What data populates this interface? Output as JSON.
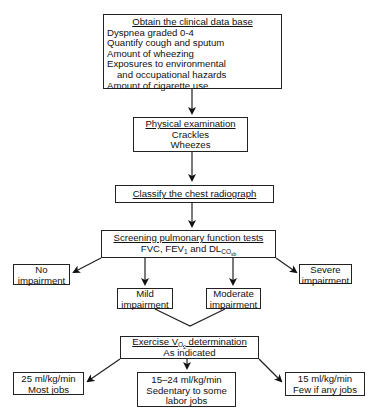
{
  "flowchart": {
    "clinical_data": {
      "title": "Obtain the clinical data base",
      "items": [
        "Dyspnea graded 0-4",
        "Quantify cough and sputum",
        "Amount of wheezing",
        "Exposures to environmental",
        "and occupational hazards",
        "Amount of cigarette use"
      ]
    },
    "physical_exam": {
      "title": "Physical examination",
      "items": [
        "Crackles",
        "Wheezes"
      ]
    },
    "radiograph": {
      "title": "Classify the chest radiograph"
    },
    "screening": {
      "title": "Screening pulmonary function tests",
      "line2_a": "FVC, FEV",
      "line2_sub1": "1",
      "line2_b": " and DL",
      "line2_sub2": "CO",
      "line2_sub3": "sb"
    },
    "impairment": {
      "none": [
        "No",
        "impairment"
      ],
      "mild": [
        "Mild",
        "impairment"
      ],
      "moderate": [
        "Moderate",
        "impairment"
      ],
      "severe": [
        "Severe",
        "impairment"
      ]
    },
    "exercise": {
      "title_a": "Exercise V",
      "title_sub1": "O",
      "title_sub2": "2",
      "title_b": " determination",
      "line2": "As indicated"
    },
    "results": {
      "high": [
        "25 ml/kg/min",
        "Most jobs"
      ],
      "mid": [
        "15–24 ml/kg/min",
        "Sedentary to some",
        "labor jobs"
      ],
      "low": [
        "15 ml/kg/min",
        "Few if any jobs"
      ]
    }
  },
  "colors": {
    "line": "#222222",
    "background": "#ffffff"
  }
}
